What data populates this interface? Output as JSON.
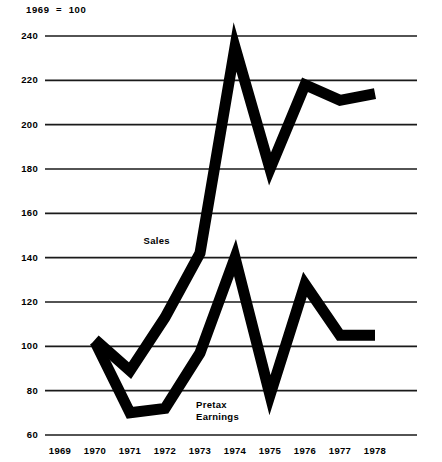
{
  "chart_data": {
    "type": "line",
    "title": "",
    "subtitle": "",
    "index_note": "1969  =  100",
    "xlabel": "",
    "ylabel": "",
    "x": [
      1969,
      1970,
      1971,
      1972,
      1973,
      1974,
      1975,
      1976,
      1977,
      1978
    ],
    "categories": [
      "1969",
      "1970",
      "1971",
      "1972",
      "1973",
      "1974",
      "1975",
      "1976",
      "1977",
      "1978"
    ],
    "xlim": [
      1968.4,
      1978.6
    ],
    "ylim": [
      60,
      240
    ],
    "yticks": [
      240,
      220,
      200,
      180,
      160,
      140,
      120,
      100,
      80,
      60
    ],
    "ytick_labels": [
      "240",
      "220",
      "200",
      "180",
      "160",
      "140",
      "120",
      "100",
      "80",
      "60"
    ],
    "grid": true,
    "grid_axis": "y",
    "legend": "inline-annotations",
    "line_color": "#000000",
    "grid_color": "#1a1a1a",
    "background": "#ffffff",
    "series": [
      {
        "name": "Sales",
        "label": "Sales",
        "x": [
          1970,
          1971,
          1972,
          1973,
          1974,
          1975,
          1976,
          1977,
          1978
        ],
        "values": [
          103,
          89,
          113,
          142,
          235,
          180,
          218,
          211,
          214
        ]
      },
      {
        "name": "Pretax Earnings",
        "label": "Pretax\nEarnings",
        "x": [
          1970,
          1971,
          1972,
          1973,
          1974,
          1975,
          1976,
          1977,
          1978
        ],
        "values": [
          102,
          70,
          72,
          97,
          140,
          78,
          128,
          105,
          105
        ]
      }
    ],
    "annotations": [
      {
        "text": "Sales",
        "x": 1971.9,
        "y": 147
      },
      {
        "text": "Pretax\nEarnings",
        "x": 1973.4,
        "y": 73
      }
    ]
  }
}
